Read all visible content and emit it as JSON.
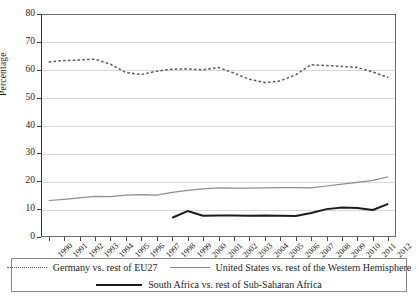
{
  "chart_data": {
    "type": "line",
    "title": "",
    "xlabel": "",
    "ylabel": "Percentage",
    "ylim": [
      0,
      80
    ],
    "ytick_step": 10,
    "grid": true,
    "legend_position": "bottom",
    "yticks": [
      "0",
      "10",
      "20",
      "30",
      "40",
      "50",
      "60",
      "70",
      "80"
    ],
    "categories": [
      "1990",
      "1991",
      "1992",
      "1993",
      "1994",
      "1995",
      "1996",
      "1997",
      "1998",
      "1999",
      "2000",
      "2001",
      "2002",
      "2003",
      "2004",
      "2005",
      "2006",
      "2007",
      "2008",
      "2009",
      "2010",
      "2011",
      "2012"
    ],
    "series": [
      {
        "name": "Germany vs. rest of EU27",
        "style": "dotted",
        "color": "#5a5a5a",
        "values": [
          62.8,
          63.3,
          63.5,
          63.8,
          62.0,
          59.0,
          58.3,
          59.5,
          60.2,
          60.3,
          60.0,
          60.8,
          58.8,
          56.6,
          55.4,
          56.0,
          58.2,
          61.8,
          61.5,
          61.2,
          60.8,
          59.2,
          57.2
        ]
      },
      {
        "name": "United States vs. rest of the Western Hemisphere",
        "style": "solid-gray",
        "color": "#8e8e8e",
        "values": [
          13.1,
          13.5,
          14.0,
          14.6,
          14.5,
          15.0,
          15.2,
          15.0,
          16.0,
          16.7,
          17.3,
          17.6,
          17.5,
          17.5,
          17.6,
          17.7,
          17.7,
          17.6,
          18.3,
          19.0,
          19.6,
          20.3,
          21.6
        ]
      },
      {
        "name": "South Africa vs. rest of Sub-Saharan Africa",
        "style": "solid-black",
        "color": "#1c1c1c",
        "values": [
          null,
          null,
          null,
          null,
          null,
          null,
          null,
          null,
          6.9,
          9.3,
          7.6,
          7.7,
          7.7,
          7.6,
          7.7,
          7.6,
          7.5,
          8.6,
          10.0,
          10.6,
          10.4,
          9.7,
          11.9
        ]
      }
    ]
  },
  "legend": {
    "entries": [
      {
        "label": "Germany vs. rest of EU27",
        "swatch": "dotted-line-swatch"
      },
      {
        "label": "United States vs. rest of the Western Hemisphere",
        "swatch": "gray-line-swatch"
      },
      {
        "label": "South Africa vs. rest of Sub-Saharan Africa",
        "swatch": "black-line-swatch"
      }
    ]
  }
}
